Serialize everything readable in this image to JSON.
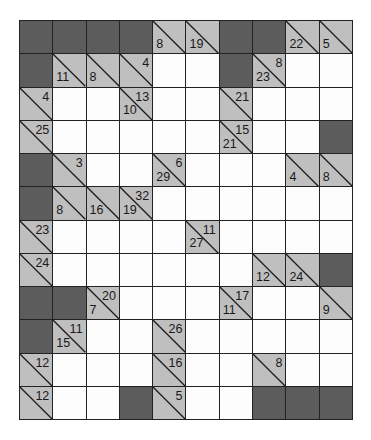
{
  "puzzle": {
    "type": "kakuro",
    "cols": 10,
    "rows": 12,
    "colors": {
      "block": "#5c5c5c",
      "clue": "#bfbfbf",
      "white": "#ffffff",
      "grid_line": "#222222"
    },
    "legend": {
      "B": "block",
      "W": "white-entry",
      "clue": "{down, across}"
    },
    "grid": [
      [
        "B",
        "B",
        "B",
        "B",
        {
          "down": "8"
        },
        {
          "down": "19"
        },
        "B",
        "B",
        {
          "down": "22"
        },
        {
          "down": "5"
        }
      ],
      [
        "B",
        {
          "down": "11"
        },
        {
          "down": "8"
        },
        {
          "across": "4"
        },
        "W",
        "W",
        "B",
        {
          "down": "23",
          "across": "8"
        },
        "W",
        "W"
      ],
      [
        {
          "across": "4"
        },
        "W",
        "W",
        {
          "down": "10",
          "across": "13"
        },
        "W",
        "W",
        {
          "across": "21"
        },
        "W",
        "W",
        "W"
      ],
      [
        {
          "across": "25"
        },
        "W",
        "W",
        "W",
        "W",
        "W",
        {
          "down": "21",
          "across": "15"
        },
        "W",
        "W",
        "B"
      ],
      [
        "B",
        {
          "across": "3"
        },
        "W",
        "W",
        {
          "down": "29",
          "across": "6"
        },
        "W",
        "W",
        "W",
        {
          "down": "4"
        },
        {
          "down": "8"
        }
      ],
      [
        "B",
        {
          "down": "8"
        },
        {
          "down": "16"
        },
        {
          "down": "19",
          "across": "32"
        },
        "W",
        "W",
        "W",
        "W",
        "W",
        "W"
      ],
      [
        {
          "across": "23"
        },
        "W",
        "W",
        "W",
        "W",
        {
          "down": "27",
          "across": "11"
        },
        "W",
        "W",
        "W",
        "W"
      ],
      [
        {
          "across": "24"
        },
        "W",
        "W",
        "W",
        "W",
        "W",
        "W",
        {
          "down": "12"
        },
        {
          "down": "24"
        },
        "B"
      ],
      [
        "B",
        "B",
        {
          "down": "7",
          "across": "20"
        },
        "W",
        "W",
        "W",
        {
          "down": "11",
          "across": "17"
        },
        "W",
        "W",
        {
          "down": "9"
        }
      ],
      [
        "B",
        {
          "down": "15",
          "across": "11"
        },
        "W",
        "W",
        {
          "across": "26"
        },
        "W",
        "W",
        "W",
        "W",
        "W"
      ],
      [
        {
          "across": "12"
        },
        "W",
        "W",
        "W",
        {
          "across": "16"
        },
        "W",
        "W",
        {
          "across": "8"
        },
        "W",
        "W"
      ],
      [
        {
          "across": "12"
        },
        "W",
        "W",
        "B",
        {
          "across": "5"
        },
        "W",
        "W",
        "B",
        "B",
        "B"
      ]
    ]
  }
}
